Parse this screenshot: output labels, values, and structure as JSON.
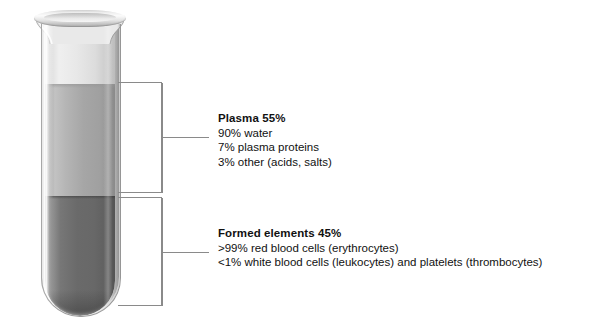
{
  "tube": {
    "label": "centrifuged blood sample test tube",
    "layers": [
      {
        "name": "air",
        "label": "air space",
        "color": "#dedede"
      },
      {
        "name": "plasma",
        "label": "plasma layer",
        "color": "#a6a6a6",
        "percent": "55%"
      },
      {
        "name": "formed_elements",
        "label": "formed elements layer",
        "color": "#6a6a6a",
        "percent": "45%"
      }
    ]
  },
  "callouts": [
    {
      "id": "plasma",
      "heading": "Plasma 55%",
      "lines": [
        "90% water",
        "7% plasma proteins",
        "3% other (acids, salts)"
      ]
    },
    {
      "id": "formed",
      "heading": "Formed elements 45%",
      "lines": [
        ">99% red blood cells (erythrocytes)",
        "<1% white blood cells (leukocytes) and platelets (thrombocytes)"
      ]
    }
  ],
  "colors": {
    "line": "#8a8a8a",
    "text": "#111111",
    "background": "#ffffff"
  }
}
